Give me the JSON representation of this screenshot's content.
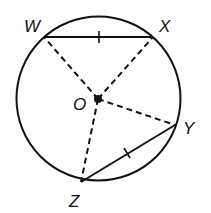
{
  "diagram": {
    "type": "circle-geometry",
    "circle": {
      "cx": 98.5,
      "cy": 98.5,
      "r": 82
    },
    "center": {
      "label": "O",
      "x": 98,
      "y": 99
    },
    "points": [
      {
        "label": "W",
        "x": 44,
        "y": 37
      },
      {
        "label": "X",
        "x": 153,
        "y": 37
      },
      {
        "label": "Y",
        "x": 175,
        "y": 125
      },
      {
        "label": "Z",
        "x": 81,
        "y": 182
      }
    ],
    "chords": [
      {
        "from": "W",
        "to": "X",
        "style": "solid",
        "tick_marks": 1
      },
      {
        "from": "Z",
        "to": "Y",
        "style": "solid",
        "tick_marks": 1
      }
    ],
    "radii": [
      {
        "from": "O",
        "to": "W",
        "style": "dashed"
      },
      {
        "from": "O",
        "to": "X",
        "style": "dashed"
      },
      {
        "from": "O",
        "to": "Y",
        "style": "dashed"
      },
      {
        "from": "O",
        "to": "Z",
        "style": "dashed"
      }
    ],
    "labels": {
      "W": "W",
      "X": "X",
      "Y": "Y",
      "Z": "Z",
      "O": "O"
    }
  }
}
